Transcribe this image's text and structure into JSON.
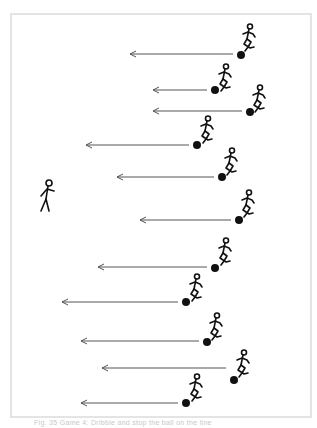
{
  "figure": {
    "caption": "Fig. 35 Game 4: Dribble and stop the ball on the line",
    "frame_color": "#e4e4e4",
    "ink_color": "#111111",
    "arrow_color": "#555555"
  },
  "standing_player": {
    "x": 45,
    "y": 180
  },
  "rows": [
    {
      "arrow_y": 54,
      "arrow_tip_x": 130,
      "ball_x": 241,
      "ball_y": 55,
      "runner_x": 246,
      "runner_y": 24
    },
    {
      "arrow_y": 90,
      "arrow_tip_x": 153,
      "ball_x": 215,
      "ball_y": 90,
      "runner_x": 222,
      "runner_y": 64
    },
    {
      "arrow_y": 111,
      "arrow_tip_x": 153,
      "ball_x": 250,
      "ball_y": 112,
      "runner_x": 256,
      "runner_y": 85
    },
    {
      "arrow_y": 145,
      "arrow_tip_x": 86,
      "ball_x": 197,
      "ball_y": 145,
      "runner_x": 204,
      "runner_y": 116
    },
    {
      "arrow_y": 177,
      "arrow_tip_x": 117,
      "ball_x": 222,
      "ball_y": 177,
      "runner_x": 228,
      "runner_y": 148
    },
    {
      "arrow_y": 220,
      "arrow_tip_x": 140,
      "ball_x": 239,
      "ball_y": 220,
      "runner_x": 245,
      "runner_y": 190
    },
    {
      "arrow_y": 267,
      "arrow_tip_x": 98,
      "ball_x": 215,
      "ball_y": 268,
      "runner_x": 222,
      "runner_y": 238
    },
    {
      "arrow_y": 302,
      "arrow_tip_x": 62,
      "ball_x": 186,
      "ball_y": 302,
      "runner_x": 193,
      "runner_y": 274
    },
    {
      "arrow_y": 341,
      "arrow_tip_x": 81,
      "ball_x": 207,
      "ball_y": 342,
      "runner_x": 213,
      "runner_y": 313
    },
    {
      "arrow_y": 368,
      "arrow_tip_x": 102,
      "ball_x": 234,
      "ball_y": 380,
      "runner_x": 240,
      "runner_y": 350
    },
    {
      "arrow_y": 403,
      "arrow_tip_x": 81,
      "ball_x": 186,
      "ball_y": 403,
      "runner_x": 193,
      "runner_y": 374
    }
  ]
}
